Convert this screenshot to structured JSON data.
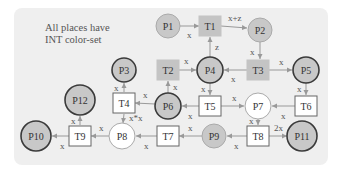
{
  "note": {
    "line1": "All places have",
    "line2": "INT color-set"
  },
  "colors": {
    "place_fill": "#c8c8c8",
    "place_white": "#ffffff",
    "transition_fill": "#c4c4c4",
    "stroke": "#444444",
    "arc": "#999999",
    "panel": "#efefef"
  },
  "places": [
    {
      "id": "P1",
      "label": "P1",
      "x": 168,
      "y": 26,
      "r": 12,
      "fill": "gray",
      "thick": false
    },
    {
      "id": "P2",
      "label": "P2",
      "x": 260,
      "y": 30,
      "r": 12,
      "fill": "gray",
      "thick": false
    },
    {
      "id": "P3",
      "label": "P3",
      "x": 124,
      "y": 70,
      "r": 12,
      "fill": "gray",
      "thick": true
    },
    {
      "id": "P4",
      "label": "P4",
      "x": 210,
      "y": 70,
      "r": 13,
      "fill": "gray",
      "thick": true
    },
    {
      "id": "P5",
      "label": "P5",
      "x": 306,
      "y": 70,
      "r": 13,
      "fill": "gray",
      "thick": true
    },
    {
      "id": "P6",
      "label": "P6",
      "x": 168,
      "y": 106,
      "r": 13,
      "fill": "gray",
      "thick": true
    },
    {
      "id": "P7",
      "label": "P7",
      "x": 258,
      "y": 106,
      "r": 13,
      "fill": "white",
      "thick": false
    },
    {
      "id": "P8",
      "label": "P8",
      "x": 122,
      "y": 136,
      "r": 13,
      "fill": "white",
      "thick": false
    },
    {
      "id": "P9",
      "label": "P9",
      "x": 214,
      "y": 136,
      "r": 12,
      "fill": "gray",
      "thick": false
    },
    {
      "id": "P10",
      "label": "P10",
      "x": 36,
      "y": 136,
      "r": 15,
      "fill": "gray",
      "thick": true
    },
    {
      "id": "P11",
      "label": "P11",
      "x": 302,
      "y": 136,
      "r": 15,
      "fill": "gray",
      "thick": true
    },
    {
      "id": "P12",
      "label": "P12",
      "x": 80,
      "y": 100,
      "r": 15,
      "fill": "gray",
      "thick": true
    }
  ],
  "transitions": [
    {
      "id": "T1",
      "label": "T1",
      "x": 210,
      "y": 26,
      "filled": true
    },
    {
      "id": "T2",
      "label": "T2",
      "x": 168,
      "y": 70,
      "filled": true
    },
    {
      "id": "T3",
      "label": "T3",
      "x": 258,
      "y": 70,
      "filled": true
    },
    {
      "id": "T4",
      "label": "T4",
      "x": 124,
      "y": 103,
      "filled": false
    },
    {
      "id": "T5",
      "label": "T5",
      "x": 210,
      "y": 106,
      "filled": false
    },
    {
      "id": "T6",
      "label": "T6",
      "x": 306,
      "y": 106,
      "filled": false
    },
    {
      "id": "T7",
      "label": "T7",
      "x": 168,
      "y": 136,
      "filled": false
    },
    {
      "id": "T8",
      "label": "T8",
      "x": 258,
      "y": 136,
      "filled": false
    },
    {
      "id": "T9",
      "label": "T9",
      "x": 80,
      "y": 136,
      "filled": false
    }
  ],
  "arcs": [
    {
      "from": "P1",
      "to": "T1",
      "label": "x",
      "x1": 180,
      "y1": 26,
      "x2": 199,
      "y2": 26,
      "lx": 187,
      "ly": 38
    },
    {
      "from": "T1",
      "to": "P2",
      "label": "x+z",
      "x1": 221,
      "y1": 26,
      "x2": 247,
      "y2": 28,
      "lx": 228,
      "ly": 21
    },
    {
      "from": "P4",
      "to": "T1",
      "label": "z",
      "x1": 210,
      "y1": 57,
      "x2": 210,
      "y2": 37,
      "lx": 215,
      "ly": 50
    },
    {
      "from": "P2",
      "to": "T3",
      "label": "x",
      "x1": 260,
      "y1": 42,
      "x2": 260,
      "y2": 59,
      "lx": 250,
      "ly": 55
    },
    {
      "from": "T3",
      "to": "P4",
      "label": "x",
      "x1": 247,
      "y1": 70,
      "x2": 224,
      "y2": 70,
      "lx": 231,
      "ly": 82
    },
    {
      "from": "T3",
      "to": "P5",
      "label": "x",
      "x1": 269,
      "y1": 70,
      "x2": 292,
      "y2": 70,
      "lx": 279,
      "ly": 65
    },
    {
      "from": "T2",
      "to": "P4",
      "label": "x",
      "x1": 179,
      "y1": 70,
      "x2": 196,
      "y2": 70,
      "lx": 184,
      "ly": 64
    },
    {
      "from": "P6",
      "to": "T2",
      "label": "x",
      "x1": 168,
      "y1": 93,
      "x2": 168,
      "y2": 81,
      "lx": 173,
      "ly": 90
    },
    {
      "from": "P4",
      "to": "T5",
      "label": "x",
      "x1": 210,
      "y1": 83,
      "x2": 210,
      "y2": 95,
      "lx": 201,
      "ly": 92
    },
    {
      "from": "T5",
      "to": "P6",
      "label": "x",
      "x1": 199,
      "y1": 106,
      "x2": 182,
      "y2": 106,
      "lx": 188,
      "ly": 119
    },
    {
      "from": "T5",
      "to": "P7",
      "label": "x",
      "x1": 221,
      "y1": 106,
      "x2": 244,
      "y2": 106,
      "lx": 232,
      "ly": 101
    },
    {
      "from": "P5",
      "to": "T6",
      "label": "x",
      "x1": 306,
      "y1": 83,
      "x2": 306,
      "y2": 95,
      "lx": 297,
      "ly": 92
    },
    {
      "from": "T6",
      "to": "P7",
      "label": "x",
      "x1": 295,
      "y1": 106,
      "x2": 272,
      "y2": 106,
      "lx": 281,
      "ly": 119
    },
    {
      "from": "P6",
      "to": "T4",
      "label": "x",
      "x1": 155,
      "y1": 104,
      "x2": 135,
      "y2": 103,
      "lx": 143,
      "ly": 98
    },
    {
      "from": "T4",
      "to": "P3",
      "label": "x",
      "x1": 124,
      "y1": 92,
      "x2": 124,
      "y2": 83,
      "lx": 114,
      "ly": 91
    },
    {
      "from": "T4",
      "to": "P8",
      "label": "x*x",
      "x1": 124,
      "y1": 114,
      "x2": 123,
      "y2": 123,
      "lx": 129,
      "ly": 121
    },
    {
      "from": "P7",
      "to": "T8",
      "label": "x",
      "x1": 258,
      "y1": 119,
      "x2": 258,
      "y2": 125,
      "lx": 249,
      "ly": 124
    },
    {
      "from": "T8",
      "to": "P9",
      "label": "x",
      "x1": 247,
      "y1": 136,
      "x2": 227,
      "y2": 136,
      "lx": 234,
      "ly": 149
    },
    {
      "from": "T8",
      "to": "P11",
      "label": "2x",
      "x1": 269,
      "y1": 136,
      "x2": 287,
      "y2": 136,
      "lx": 274,
      "ly": 131
    },
    {
      "from": "P9",
      "to": "T7",
      "label": "x",
      "x1": 202,
      "y1": 136,
      "x2": 179,
      "y2": 136,
      "lx": 188,
      "ly": 131
    },
    {
      "from": "T7",
      "to": "P8",
      "label": "x",
      "x1": 157,
      "y1": 136,
      "x2": 136,
      "y2": 136,
      "lx": 144,
      "ly": 149
    },
    {
      "from": "P8",
      "to": "T9",
      "label": "x",
      "x1": 109,
      "y1": 136,
      "x2": 91,
      "y2": 136,
      "lx": 99,
      "ly": 131
    },
    {
      "from": "T9",
      "to": "P12",
      "label": "x",
      "x1": 80,
      "y1": 125,
      "x2": 80,
      "y2": 116,
      "lx": 71,
      "ly": 124
    },
    {
      "from": "T9",
      "to": "P10",
      "label": "x",
      "x1": 69,
      "y1": 136,
      "x2": 52,
      "y2": 136,
      "lx": 60,
      "ly": 149
    }
  ]
}
